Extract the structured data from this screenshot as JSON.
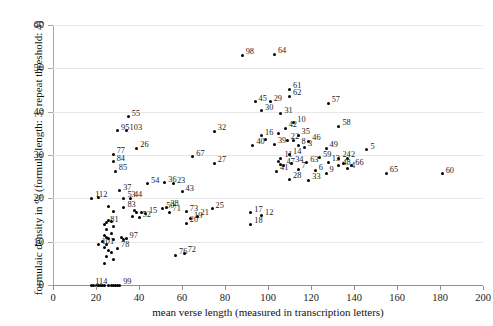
{
  "chart_data": {
    "type": "scatter",
    "title": "",
    "xlabel": "mean verse length (measured in transcription letters)",
    "ylabel": "formulaic density in % (formula length: 3, repeat threshold: 4)",
    "xlim": [
      0,
      200
    ],
    "ylim": [
      0,
      60
    ],
    "xticks": [
      0,
      20,
      40,
      60,
      80,
      100,
      120,
      140,
      160,
      180,
      200
    ],
    "yticks": [
      0,
      10,
      20,
      30,
      40,
      50,
      60
    ],
    "grid": "horizontal",
    "legend": "none",
    "point_color": "#000000",
    "points": [
      {
        "label": "98",
        "x": 88,
        "y": 53.0
      },
      {
        "label": "64",
        "x": 103,
        "y": 53.3
      },
      {
        "label": "61",
        "x": 110,
        "y": 45.2
      },
      {
        "label": "62",
        "x": 110,
        "y": 43.6
      },
      {
        "label": "45",
        "x": 94,
        "y": 42.3
      },
      {
        "label": "29",
        "x": 101,
        "y": 42.3
      },
      {
        "label": "57",
        "x": 128,
        "y": 42.0
      },
      {
        "label": "30",
        "x": 97,
        "y": 40.2
      },
      {
        "label": "31",
        "x": 106,
        "y": 39.5
      },
      {
        "label": "55",
        "x": 35,
        "y": 38.8
      },
      {
        "label": "10",
        "x": 112,
        "y": 37.5
      },
      {
        "label": "58",
        "x": 133,
        "y": 36.6
      },
      {
        "label": "95",
        "x": 30,
        "y": 35.6
      },
      {
        "label": "103",
        "x": 34,
        "y": 35.6
      },
      {
        "label": "32",
        "x": 75,
        "y": 35.5
      },
      {
        "label": "42",
        "x": 108,
        "y": 36.2
      },
      {
        "label": "16",
        "x": 97,
        "y": 34.5
      },
      {
        "label": "35",
        "x": 114,
        "y": 34.6
      },
      {
        "label": "22",
        "x": 109,
        "y": 33.4
      },
      {
        "label": "46",
        "x": 119,
        "y": 33.2
      },
      {
        "label": "40",
        "x": 93,
        "y": 32.3
      },
      {
        "label": "39",
        "x": 103,
        "y": 32.5
      },
      {
        "label": "8",
        "x": 114,
        "y": 32.2
      },
      {
        "label": "3",
        "x": 117,
        "y": 31.8
      },
      {
        "label": "26",
        "x": 39,
        "y": 31.6
      },
      {
        "label": "49",
        "x": 127,
        "y": 31.6
      },
      {
        "label": "5",
        "x": 146,
        "y": 31.2
      },
      {
        "label": "77",
        "x": 28,
        "y": 30.2
      },
      {
        "label": "67",
        "x": 65,
        "y": 29.6
      },
      {
        "label": "59",
        "x": 124,
        "y": 29.4
      },
      {
        "label": "14",
        "x": 110,
        "y": 30.1
      },
      {
        "label": "11",
        "x": 106,
        "y": 29.2
      },
      {
        "label": "24",
        "x": 133,
        "y": 29.3
      },
      {
        "label": "2",
        "x": 137,
        "y": 29.3
      },
      {
        "label": "84",
        "x": 28,
        "y": 28.4
      },
      {
        "label": "13",
        "x": 128,
        "y": 28.3
      },
      {
        "label": "27",
        "x": 75,
        "y": 28.1
      },
      {
        "label": "34",
        "x": 111,
        "y": 28.1
      },
      {
        "label": "63",
        "x": 118,
        "y": 28.2
      },
      {
        "label": "47",
        "x": 107,
        "y": 27.6
      },
      {
        "label": "48",
        "x": 133,
        "y": 27.5
      },
      {
        "label": "66",
        "x": 139,
        "y": 27.5
      },
      {
        "label": "4",
        "x": 137,
        "y": 26.8
      },
      {
        "label": "85",
        "x": 29,
        "y": 26.2
      },
      {
        "label": "41",
        "x": 104,
        "y": 26.3
      },
      {
        "label": "7",
        "x": 114,
        "y": 26.7
      },
      {
        "label": "6",
        "x": 122,
        "y": 26.4
      },
      {
        "label": "9",
        "x": 127,
        "y": 25.8
      },
      {
        "label": "65",
        "x": 155,
        "y": 25.8
      },
      {
        "label": "60",
        "x": 181,
        "y": 25.7
      },
      {
        "label": "54",
        "x": 44,
        "y": 23.4
      },
      {
        "label": "36",
        "x": 52,
        "y": 23.6
      },
      {
        "label": "23",
        "x": 56,
        "y": 23.4
      },
      {
        "label": "28",
        "x": 110,
        "y": 24.4
      },
      {
        "label": "33",
        "x": 119,
        "y": 24.2
      },
      {
        "label": "37",
        "x": 31,
        "y": 21.8
      },
      {
        "label": "43",
        "x": 60,
        "y": 21.5
      },
      {
        "label": "112",
        "x": 18,
        "y": 20.0
      },
      {
        "label": "53",
        "x": 33,
        "y": 20.0
      },
      {
        "label": "44",
        "x": 36,
        "y": 20.0
      },
      {
        "label": "83",
        "x": 33,
        "y": 17.8
      },
      {
        "label": "50",
        "x": 51,
        "y": 17.6
      },
      {
        "label": "38",
        "x": 53,
        "y": 17.9
      },
      {
        "label": "71",
        "x": 54,
        "y": 16.8
      },
      {
        "label": "73",
        "x": 62,
        "y": 16.9
      },
      {
        "label": "25",
        "x": 74,
        "y": 17.6
      },
      {
        "label": "15",
        "x": 43,
        "y": 16.4
      },
      {
        "label": "52",
        "x": 40,
        "y": 15.5
      },
      {
        "label": "19",
        "x": 64,
        "y": 15.3
      },
      {
        "label": "21",
        "x": 67,
        "y": 15.9
      },
      {
        "label": "20",
        "x": 62,
        "y": 14.2
      },
      {
        "label": "81",
        "x": 25,
        "y": 14.4
      },
      {
        "label": "17",
        "x": 92,
        "y": 16.7
      },
      {
        "label": "12",
        "x": 97,
        "y": 16.0
      },
      {
        "label": "18",
        "x": 92,
        "y": 14.0
      },
      {
        "label": "97",
        "x": 34,
        "y": 10.7
      },
      {
        "label": "101",
        "x": 21,
        "y": 9.3
      },
      {
        "label": "78",
        "x": 30,
        "y": 8.5
      },
      {
        "label": "76",
        "x": 57,
        "y": 6.9
      },
      {
        "label": "72",
        "x": 61,
        "y": 7.3
      },
      {
        "label": "114",
        "x": 18,
        "y": 0.0
      },
      {
        "label": "99",
        "x": 31,
        "y": 0.0
      },
      {
        "label": "",
        "x": 26,
        "y": 18.2
      },
      {
        "label": "",
        "x": 28,
        "y": 17.0
      },
      {
        "label": "",
        "x": 38,
        "y": 17.3
      },
      {
        "label": "",
        "x": 39,
        "y": 16.7
      },
      {
        "label": "",
        "x": 41,
        "y": 16.8
      },
      {
        "label": "",
        "x": 37,
        "y": 15.8
      },
      {
        "label": "",
        "x": 26,
        "y": 15.0
      },
      {
        "label": "",
        "x": 27,
        "y": 14.7
      },
      {
        "label": "",
        "x": 28,
        "y": 13.6
      },
      {
        "label": "",
        "x": 24,
        "y": 14.0
      },
      {
        "label": "",
        "x": 25,
        "y": 12.7
      },
      {
        "label": "",
        "x": 27,
        "y": 11.9
      },
      {
        "label": "",
        "x": 24,
        "y": 11.5
      },
      {
        "label": "",
        "x": 25,
        "y": 10.9
      },
      {
        "label": "",
        "x": 26,
        "y": 10.8
      },
      {
        "label": "",
        "x": 28,
        "y": 10.6
      },
      {
        "label": "",
        "x": 32,
        "y": 11.0
      },
      {
        "label": "",
        "x": 33,
        "y": 10.5
      },
      {
        "label": "",
        "x": 23,
        "y": 10.0
      },
      {
        "label": "",
        "x": 25,
        "y": 9.4
      },
      {
        "label": "",
        "x": 24,
        "y": 8.6
      },
      {
        "label": "",
        "x": 26,
        "y": 8.0
      },
      {
        "label": "",
        "x": 27,
        "y": 7.4
      },
      {
        "label": "",
        "x": 25,
        "y": 6.5
      },
      {
        "label": "",
        "x": 28,
        "y": 6.0
      },
      {
        "label": "",
        "x": 24,
        "y": 5.0
      },
      {
        "label": "",
        "x": 19,
        "y": 0.0
      },
      {
        "label": "",
        "x": 20,
        "y": 0.0
      },
      {
        "label": "",
        "x": 21,
        "y": 0.0
      },
      {
        "label": "",
        "x": 22,
        "y": 0.0
      },
      {
        "label": "",
        "x": 23,
        "y": 0.0
      },
      {
        "label": "",
        "x": 24,
        "y": 0.0
      },
      {
        "label": "",
        "x": 26,
        "y": 0.0
      },
      {
        "label": "",
        "x": 27,
        "y": 0.0
      },
      {
        "label": "",
        "x": 28,
        "y": 0.0
      },
      {
        "label": "",
        "x": 29,
        "y": 0.0
      },
      {
        "label": "",
        "x": 30,
        "y": 0.0
      },
      {
        "label": "",
        "x": 105,
        "y": 35.0
      },
      {
        "label": "",
        "x": 99,
        "y": 33.5
      },
      {
        "label": "",
        "x": 112,
        "y": 33.3
      },
      {
        "label": "",
        "x": 106,
        "y": 27.9
      },
      {
        "label": "",
        "x": 105,
        "y": 28.4
      },
      {
        "label": "",
        "x": 135,
        "y": 28.0
      },
      {
        "label": "",
        "x": 21,
        "y": 20.2
      }
    ]
  }
}
